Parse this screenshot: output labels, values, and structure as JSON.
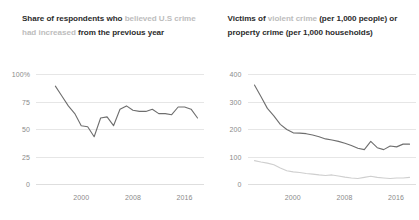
{
  "panels": [
    {
      "title_prefix": "Share of respondents who ",
      "title_highlight": "believed U.S crime had increased",
      "title_suffix": " from the previous year"
    },
    {
      "title_prefix": "Victims of ",
      "title_highlight": "violent crime",
      "title_suffix": " (per 1,000 people) or property crime (per 1,000 households)"
    }
  ],
  "colors": {
    "line_dark": "#6e6e6e",
    "line_light": "#cfcfcf",
    "grid": "#e6e6e6",
    "text": "#2b2b2b",
    "muted": "#8a8a8a",
    "highlight": "#bdbdbd",
    "background": "#ffffff"
  },
  "chart_data": [
    {
      "type": "line",
      "title": "Share of respondents who believed U.S crime had increased from the previous year",
      "xlabel": "",
      "ylabel": "",
      "xlim": [
        1993,
        2019
      ],
      "ylim": [
        0,
        100
      ],
      "yticks": [
        0,
        25,
        50,
        75,
        100
      ],
      "ytick_labels": [
        "0",
        "25",
        "50",
        "75",
        "100%"
      ],
      "xticks": [
        2000,
        2008,
        2016
      ],
      "xtick_labels": [
        "2000",
        "2008",
        "2016"
      ],
      "grid": true,
      "legend": "none",
      "series": [
        {
          "name": "Believed crime increased",
          "color": "#6e6e6e",
          "x": [
            1996,
            1997,
            1998,
            1999,
            2000,
            2001,
            2002,
            2003,
            2004,
            2005,
            2006,
            2007,
            2008,
            2009,
            2010,
            2011,
            2012,
            2013,
            2014,
            2015,
            2016,
            2017,
            2018
          ],
          "values": [
            89,
            80,
            71,
            64,
            53,
            52,
            43,
            60,
            61,
            53,
            68,
            71,
            67,
            66,
            66,
            68,
            64,
            64,
            63,
            70,
            70,
            68,
            60
          ]
        }
      ]
    },
    {
      "type": "line",
      "title": "Victims of violent crime (per 1,000 people) or property crime (per 1,000 households)",
      "xlabel": "",
      "ylabel": "",
      "xlim": [
        1993,
        2019
      ],
      "ylim": [
        0,
        400
      ],
      "yticks": [
        0,
        100,
        200,
        300,
        400
      ],
      "ytick_labels": [
        "0",
        "100",
        "200",
        "300",
        "400"
      ],
      "xticks": [
        2000,
        2008,
        2016
      ],
      "xtick_labels": [
        "2000",
        "2008",
        "2016"
      ],
      "grid": true,
      "legend": "none",
      "series": [
        {
          "name": "Property crime (per 1,000 households)",
          "color": "#6e6e6e",
          "x": [
            1994,
            1995,
            1996,
            1997,
            1998,
            1999,
            2000,
            2001,
            2002,
            2003,
            2004,
            2005,
            2006,
            2007,
            2008,
            2009,
            2010,
            2011,
            2012,
            2013,
            2014,
            2015,
            2016,
            2017,
            2018
          ],
          "values": [
            360,
            318,
            275,
            248,
            217,
            198,
            186,
            185,
            183,
            178,
            172,
            164,
            160,
            155,
            148,
            140,
            130,
            125,
            155,
            132,
            125,
            138,
            135,
            145,
            145
          ]
        },
        {
          "name": "Violent crime (per 1,000 people)",
          "color": "#cfcfcf",
          "x": [
            1994,
            1995,
            1996,
            1997,
            1998,
            1999,
            2000,
            2001,
            2002,
            2003,
            2004,
            2005,
            2006,
            2007,
            2008,
            2009,
            2010,
            2011,
            2012,
            2013,
            2014,
            2015,
            2016,
            2017,
            2018
          ],
          "values": [
            85,
            80,
            76,
            70,
            58,
            48,
            44,
            42,
            38,
            36,
            33,
            31,
            33,
            29,
            25,
            22,
            20,
            24,
            28,
            24,
            22,
            20,
            22,
            22,
            24
          ]
        }
      ]
    }
  ]
}
